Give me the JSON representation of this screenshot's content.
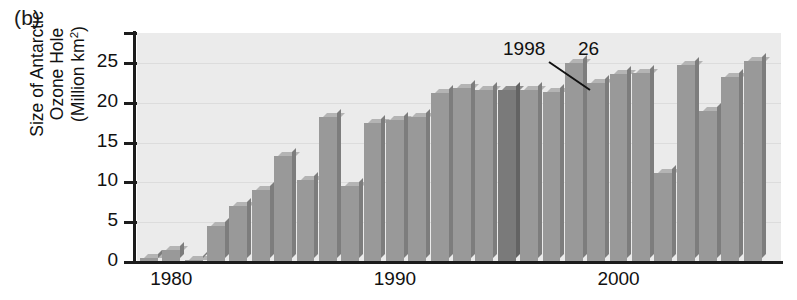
{
  "figure": {
    "panel_letter": "(b)",
    "y_axis_title_lines": [
      "Size of Antarctic",
      "Ozone Hole",
      "(Million km2)"
    ],
    "y_axis_title_sup": "2"
  },
  "annotations": [
    {
      "name": "callout-1998",
      "text": "1998",
      "x": 503,
      "y": 38
    },
    {
      "name": "callout-26",
      "text": "26",
      "x": 578,
      "y": 38
    }
  ],
  "leader_line": {
    "x1": 549,
    "y1": 62,
    "x2": 590,
    "y2": 90
  },
  "chart_data": {
    "type": "bar",
    "title": "",
    "xlabel": "",
    "ylabel": "Size of Antarctic Ozone Hole (Million km2)",
    "ylim": [
      0,
      28
    ],
    "xlim": [
      1978.5,
      2006.5
    ],
    "yticks": [
      0,
      5,
      10,
      15,
      20,
      25
    ],
    "ytick_labels": [
      "0",
      "5",
      "10",
      "15",
      "20",
      "25"
    ],
    "xticks": [
      1980,
      1990,
      2000
    ],
    "xtick_labels": [
      "1980",
      "1990",
      "2000"
    ],
    "grid": true,
    "legend": "none",
    "bar_color": "#999999",
    "highlight_color": "#7a7a7a",
    "plot_background": "#ebebeb",
    "categories": [
      1979,
      1980,
      1981,
      1982,
      1983,
      1984,
      1985,
      1986,
      1987,
      1988,
      1989,
      1990,
      1991,
      1992,
      1993,
      1994,
      1995,
      1996,
      1997,
      1998,
      1999,
      2000,
      2001,
      2002,
      2003,
      2004,
      2005,
      2006
    ],
    "values": [
      0.5,
      1.5,
      0.3,
      4.5,
      7.0,
      9.0,
      13.3,
      10.3,
      18.2,
      9.5,
      17.5,
      17.8,
      18.2,
      21.2,
      21.8,
      21.6,
      21.6,
      21.6,
      21.3,
      25.0,
      22.5,
      23.6,
      23.7,
      11.2,
      24.7,
      19.0,
      23.3,
      25.2
    ],
    "highlight_index": 16,
    "callout_index": 19,
    "callout_label": "1998",
    "callout_value_label": "26"
  }
}
